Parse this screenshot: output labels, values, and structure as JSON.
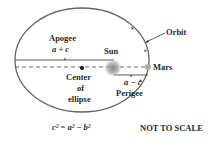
{
  "diagram": {
    "labels": {
      "orbit": "Orbit",
      "apogee": "Apogee",
      "apogee_formula": "a + c",
      "sun": "Sun",
      "mars": "Mars",
      "center_line1": "Center",
      "center_line2": "of",
      "center_line3": "ellipse",
      "perigee_formula": "a − c",
      "perigee": "Perigee",
      "equation": "c² = a² − b²",
      "note": "NOT TO SCALE"
    },
    "colors": {
      "orbit": "#555555",
      "text": "#2a2a2a",
      "sun": "#999999",
      "mars": "#aaaaaa"
    }
  }
}
